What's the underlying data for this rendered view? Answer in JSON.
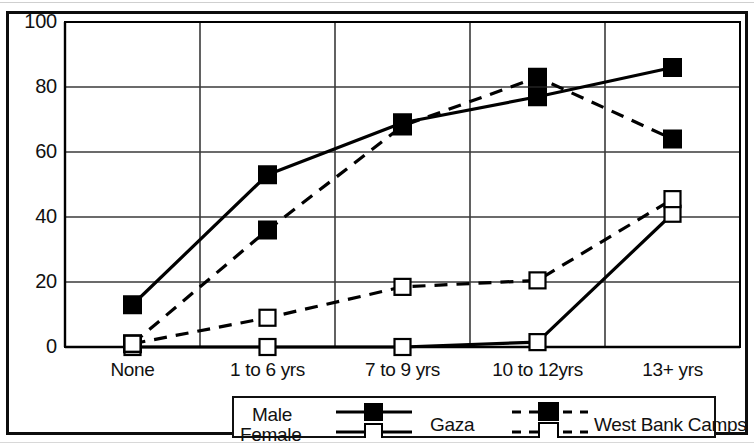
{
  "chart_data": {
    "type": "line",
    "title": "",
    "xlabel": "",
    "ylabel": "",
    "categories": [
      "None",
      "1 to 6 yrs",
      "7 to 9 yrs",
      "10 to 12yrs",
      "13+ yrs"
    ],
    "ylim": [
      0,
      100
    ],
    "ytick_labels": [
      "0",
      "20",
      "40",
      "60",
      "80",
      "100"
    ],
    "ytick_values": [
      0,
      20,
      40,
      60,
      80,
      100
    ],
    "grid": true,
    "legend_position": "bottom",
    "series": [
      {
        "name": "Gaza Male",
        "group": "Gaza",
        "sex": "Male",
        "line_style": "solid",
        "marker": "filled-square",
        "color": "#000000",
        "values": [
          13,
          53,
          69,
          77,
          86
        ]
      },
      {
        "name": "Gaza Female",
        "group": "Gaza",
        "sex": "Female",
        "line_style": "solid",
        "marker": "open-square",
        "color": "#000000",
        "values": [
          0,
          0,
          0,
          1.5,
          41
        ]
      },
      {
        "name": "West Bank Camps Male",
        "group": "West Bank Camps",
        "sex": "Male",
        "line_style": "dashed",
        "marker": "filled-square",
        "color": "#000000",
        "values": [
          1,
          36,
          68,
          83,
          64
        ]
      },
      {
        "name": "West Bank Camps Female",
        "group": "West Bank Camps",
        "sex": "Female",
        "line_style": "dashed",
        "marker": "open-square",
        "color": "#000000",
        "values": [
          1,
          9,
          18.5,
          20.5,
          45.5
        ]
      }
    ]
  },
  "axis": {
    "yticks": [
      {
        "label": "100"
      },
      {
        "label": "80"
      },
      {
        "label": "60"
      },
      {
        "label": "40"
      },
      {
        "label": "20"
      },
      {
        "label": "0"
      }
    ],
    "xticks": [
      {
        "label": "None"
      },
      {
        "label": "1 to 6 yrs"
      },
      {
        "label": "7 to 9 yrs"
      },
      {
        "label": "10 to 12yrs"
      },
      {
        "label": "13+ yrs"
      }
    ]
  },
  "legend": {
    "rows": [
      {
        "label": "Male"
      },
      {
        "label": "Female"
      }
    ],
    "groups": [
      {
        "label": "Gaza"
      },
      {
        "label": "West Bank Camps"
      }
    ]
  },
  "colors": {
    "ink": "#000000",
    "grid": "#3a3a3a",
    "frame": "#0d0d0d",
    "background": "#ffffff"
  }
}
